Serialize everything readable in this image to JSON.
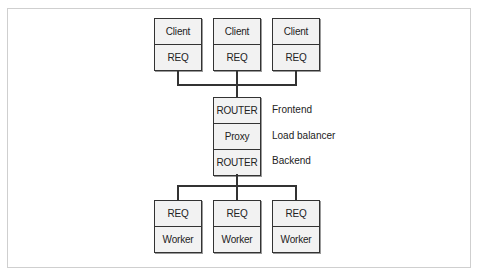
{
  "clients": [
    {
      "top": "Client",
      "bottom": "REQ"
    },
    {
      "top": "Client",
      "bottom": "REQ"
    },
    {
      "top": "Client",
      "bottom": "REQ"
    }
  ],
  "broker": {
    "cells": [
      "ROUTER",
      "Proxy",
      "ROUTER"
    ],
    "labels": [
      "Frontend",
      "Load balancer",
      "Backend"
    ]
  },
  "workers": [
    {
      "top": "REQ",
      "bottom": "Worker"
    },
    {
      "top": "REQ",
      "bottom": "Worker"
    },
    {
      "top": "REQ",
      "bottom": "Worker"
    }
  ],
  "colors": {
    "box_fill": "#f2f2f2",
    "stroke": "#333333",
    "frame": "#cfcfcf"
  }
}
